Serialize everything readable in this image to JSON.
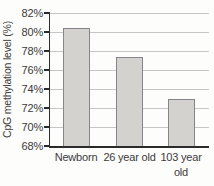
{
  "chart_data": {
    "type": "bar",
    "categories": [
      "Newborn",
      "26 year old",
      "103 year old"
    ],
    "values": [
      80.4,
      77.4,
      72.9
    ],
    "title": "",
    "xlabel": "",
    "ylabel": "CpG methylation level (%)",
    "ylim": [
      68,
      82
    ],
    "yticks": [
      82,
      80,
      78,
      76,
      74,
      72,
      70,
      68
    ],
    "ytick_labels": [
      "82%",
      "80%",
      "78%",
      "76%",
      "74%",
      "72%",
      "70%",
      "68%"
    ],
    "grid": true,
    "legend_position": "none",
    "colors": {
      "background": "#fdfdfc",
      "bar_fill": "#d3d2cf",
      "bar_border": "#85858a",
      "gridline": "#c6c6c6",
      "axis": "#2b2b2b",
      "text": "#3b3b3b"
    }
  }
}
